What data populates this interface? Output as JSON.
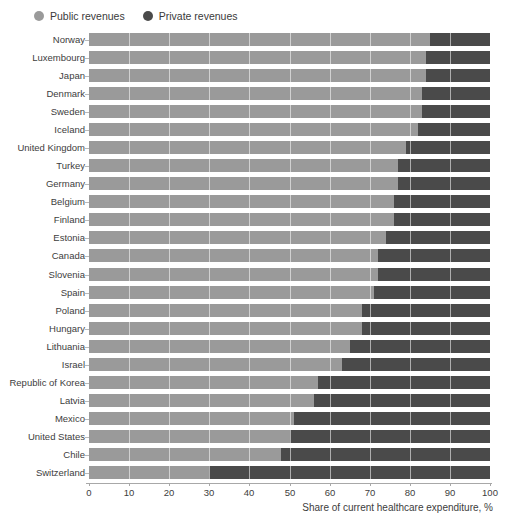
{
  "legend": {
    "position": "top-left",
    "items": [
      {
        "label": "Public revenues",
        "color": "#9a9a9a",
        "icon": "circle-swatch-icon"
      },
      {
        "label": "Private revenues",
        "color": "#4a4a4a",
        "icon": "circle-swatch-icon"
      }
    ]
  },
  "axis": {
    "x_title": "Share of current healthcare expenditure, %",
    "ticks": [
      0,
      10,
      20,
      30,
      40,
      50,
      60,
      70,
      80,
      90,
      100
    ]
  },
  "colors": {
    "public": "#9a9a9a",
    "private": "#4a4a4a",
    "gridline": "#ffffff",
    "axis": "#a8a8a8",
    "text": "#3d3d3d"
  },
  "chart_data": {
    "type": "bar",
    "orientation": "horizontal",
    "stacked": true,
    "title": "",
    "subtitle": "",
    "xlabel": "Share of current healthcare expenditure, %",
    "ylabel": "",
    "xlim": [
      0,
      100
    ],
    "xticks": [
      0,
      10,
      20,
      30,
      40,
      50,
      60,
      70,
      80,
      90,
      100
    ],
    "grid": true,
    "legend": [
      "Public revenues",
      "Private revenues"
    ],
    "legend_position": "top-left",
    "categories": [
      "Norway",
      "Luxembourg",
      "Japan",
      "Denmark",
      "Sweden",
      "Iceland",
      "United Kingdom",
      "Turkey",
      "Germany",
      "Belgium",
      "Finland",
      "Estonia",
      "Canada",
      "Slovenia",
      "Spain",
      "Poland",
      "Hungary",
      "Lithuania",
      "Israel",
      "Republic of Korea",
      "Latvia",
      "Mexico",
      "United States",
      "Chile",
      "Switzerland"
    ],
    "series": [
      {
        "name": "Public revenues",
        "color": "#9a9a9a",
        "values": [
          85,
          84,
          84,
          83,
          83,
          82,
          79,
          77,
          77,
          76,
          76,
          74,
          72,
          72,
          71,
          68,
          68,
          65,
          63,
          57,
          56,
          51,
          50,
          48,
          30
        ]
      },
      {
        "name": "Private revenues",
        "color": "#4a4a4a",
        "values": [
          15,
          16,
          16,
          17,
          17,
          18,
          21,
          23,
          23,
          24,
          24,
          26,
          28,
          28,
          29,
          32,
          32,
          35,
          37,
          43,
          44,
          49,
          50,
          52,
          70
        ]
      }
    ]
  }
}
